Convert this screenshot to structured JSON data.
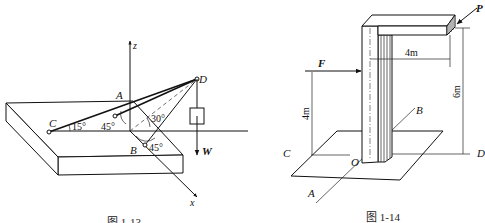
{
  "figure_left": {
    "caption": "图 1-13",
    "axis_labels": {
      "z": "z",
      "x": "x"
    },
    "points": {
      "A": "A",
      "B": "B",
      "C": "C",
      "D": "D"
    },
    "angles": {
      "angle_C": "15°",
      "angle_A": "45°",
      "angle_mid": "30°",
      "angle_B": "45°"
    },
    "load_label": "W"
  },
  "figure_right": {
    "caption": "图 1-14",
    "forces": {
      "P": "P",
      "F": "F"
    },
    "points": {
      "A": "A",
      "B": "B",
      "C": "C",
      "D": "D",
      "O": "O"
    },
    "dimensions": {
      "horizontal_arm": "4m",
      "force_height": "4m",
      "total_height": "6m"
    }
  },
  "colors": {
    "line": "#111111",
    "background": "#ffffff"
  }
}
